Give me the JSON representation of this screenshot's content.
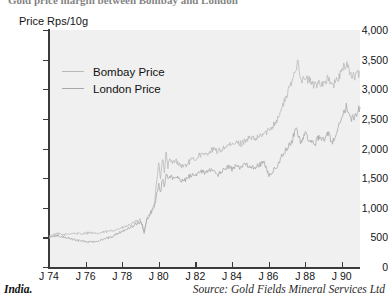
{
  "figure": {
    "title_clipped": "Gold price margin between Bombay and London",
    "footer_left": "India.",
    "footer_source": "Source: Gold Fields Mineral Services Ltd",
    "plot_bg": "#f0f0f0",
    "axis_color": "#3b3b3b"
  },
  "legend": {
    "position": "upper-left-inside",
    "entries": [
      {
        "label": "Bombay Price",
        "color": "#b9b9b9"
      },
      {
        "label": "London Price",
        "color": "#a8a8a8"
      }
    ]
  },
  "chart_data": {
    "type": "line",
    "title": "Gold price margin between Bombay and London",
    "xlabel": "",
    "ylabel": "Price Rps/10g",
    "ylim": [
      0,
      4000
    ],
    "xlim": [
      1974.0,
      1991.0
    ],
    "grid": false,
    "legend_position": "upper-left-inside",
    "ytick_labels": [
      "0",
      "500",
      "1,000",
      "1,500",
      "2,000",
      "2,500",
      "3,000",
      "3,500",
      "4,000"
    ],
    "ytick_values": [
      0,
      500,
      1000,
      1500,
      2000,
      2500,
      3000,
      3500,
      4000
    ],
    "xtick_labels": [
      "J 74",
      "J 76",
      "J 78",
      "J 80",
      "J 82",
      "J 84",
      "J 86",
      "J 88",
      "J 90"
    ],
    "xtick_values": [
      1974,
      1976,
      1978,
      1980,
      1982,
      1984,
      1986,
      1988,
      1990
    ],
    "x": [
      1974.0,
      1974.25,
      1974.5,
      1974.75,
      1975.0,
      1975.25,
      1975.5,
      1975.75,
      1976.0,
      1976.25,
      1976.5,
      1976.75,
      1977.0,
      1977.25,
      1977.5,
      1977.75,
      1978.0,
      1978.25,
      1978.5,
      1978.75,
      1979.0,
      1979.1,
      1979.2,
      1979.35,
      1979.5,
      1979.75,
      1980.0,
      1980.1,
      1980.2,
      1980.3,
      1980.4,
      1980.5,
      1980.6,
      1980.75,
      1980.9,
      1981.0,
      1981.25,
      1981.5,
      1981.75,
      1982.0,
      1982.25,
      1982.5,
      1982.75,
      1983.0,
      1983.25,
      1983.5,
      1983.75,
      1984.0,
      1984.25,
      1984.5,
      1984.75,
      1985.0,
      1985.25,
      1985.5,
      1985.75,
      1986.0,
      1986.25,
      1986.5,
      1986.75,
      1987.0,
      1987.25,
      1987.5,
      1987.6,
      1987.75,
      1987.9,
      1988.0,
      1988.25,
      1988.5,
      1988.75,
      1989.0,
      1989.25,
      1989.5,
      1989.75,
      1990.0,
      1990.25,
      1990.5,
      1990.75,
      1991.0
    ],
    "series": [
      {
        "name": "Bombay Price",
        "color": "#b9b9b9",
        "values": [
          520,
          545,
          560,
          540,
          555,
          570,
          565,
          560,
          575,
          580,
          560,
          570,
          590,
          600,
          620,
          640,
          660,
          690,
          720,
          760,
          800,
          700,
          560,
          820,
          900,
          1050,
          1750,
          1500,
          1850,
          1600,
          1900,
          1700,
          1800,
          1750,
          1800,
          1780,
          1700,
          1720,
          1800,
          1820,
          1900,
          1880,
          1950,
          1980,
          1950,
          2000,
          2050,
          2050,
          2100,
          2080,
          2150,
          2180,
          2150,
          2200,
          2250,
          2300,
          2400,
          2500,
          2700,
          2900,
          3100,
          3350,
          3520,
          3200,
          3150,
          3180,
          3150,
          3050,
          3120,
          3100,
          3180,
          3050,
          3150,
          3300,
          3450,
          3250,
          3200,
          3300
        ]
      },
      {
        "name": "London Price",
        "color": "#a8a8a8",
        "values": [
          500,
          520,
          530,
          505,
          490,
          470,
          450,
          440,
          430,
          420,
          430,
          450,
          470,
          490,
          520,
          560,
          600,
          640,
          680,
          720,
          760,
          700,
          600,
          800,
          880,
          1000,
          1400,
          1250,
          1500,
          1350,
          1600,
          1480,
          1550,
          1500,
          1520,
          1500,
          1450,
          1480,
          1550,
          1560,
          1620,
          1590,
          1650,
          1600,
          1560,
          1620,
          1700,
          1650,
          1700,
          1680,
          1750,
          1700,
          1680,
          1720,
          1780,
          1550,
          1620,
          1700,
          1900,
          2000,
          2100,
          2350,
          2250,
          2100,
          2200,
          2250,
          2150,
          2050,
          2200,
          2150,
          2250,
          2100,
          2300,
          2550,
          2700,
          2500,
          2550,
          2700
        ]
      }
    ]
  }
}
